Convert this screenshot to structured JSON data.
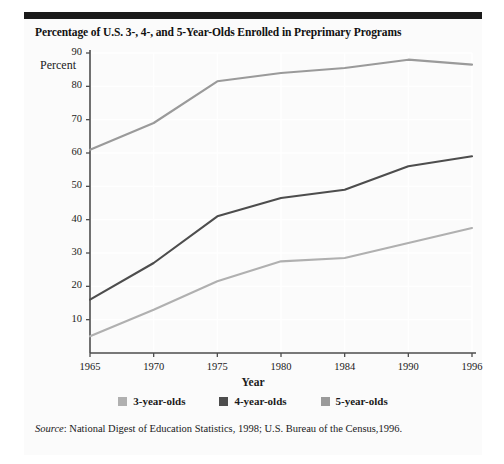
{
  "figure": {
    "title": "Percentage of U.S. 3-, 4-, and 5-Year-Olds Enrolled in Preprimary Programs",
    "y_axis_caption": "Percent",
    "source_label": "Source",
    "source_text": ": National Digest of Education Statistics, 1998; U.S. Bureau of the Census,1996.",
    "colors": {
      "series_3yo": "#b0b0b0",
      "series_4yo": "#4d4d4d",
      "series_5yo": "#9a9a9a",
      "rule": "#1a1a1a",
      "axis": "#4d4d4d",
      "grid": "#ffffff",
      "panel": "#fbfbfb"
    }
  },
  "chart_data": {
    "type": "line",
    "title": "Percentage of U.S. 3-, 4-, and 5-Year-Olds Enrolled in Preprimary Programs",
    "xlabel": "Year",
    "ylabel": "Percent",
    "categories": [
      "1965",
      "1970",
      "1975",
      "1980",
      "1984",
      "1990",
      "1996"
    ],
    "xtick_labels": [
      "1965",
      "1970",
      "1975",
      "1980",
      "1984",
      "1990",
      "1996"
    ],
    "ytick_labels": [
      "10",
      "20",
      "30",
      "40",
      "50",
      "60",
      "70",
      "80",
      "90"
    ],
    "ytick_values": [
      10,
      20,
      30,
      40,
      50,
      60,
      70,
      80,
      90
    ],
    "ylim": [
      0,
      90
    ],
    "grid": true,
    "legend_position": "bottom",
    "series": [
      {
        "name": "3-year-olds",
        "color": "#b0b0b0",
        "values": [
          5,
          13,
          21.5,
          27.5,
          28.5,
          33,
          37.5
        ]
      },
      {
        "name": "4-year-olds",
        "color": "#4d4d4d",
        "values": [
          16,
          27,
          41,
          46.5,
          49,
          56,
          59
        ]
      },
      {
        "name": "5-year-olds",
        "color": "#9a9a9a",
        "values": [
          61,
          69,
          81.5,
          84,
          85.5,
          88,
          86.5
        ]
      }
    ]
  }
}
